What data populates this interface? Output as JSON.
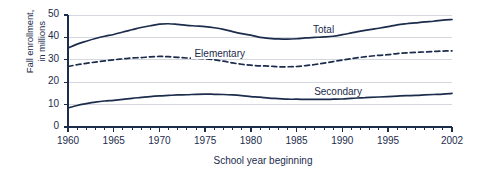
{
  "chart_data": {
    "type": "line",
    "title": "",
    "xlabel": "School year beginning",
    "ylabel_line1": "Fall enrollment,",
    "ylabel_line2": "in millions",
    "ylabel": "Fall enrollment, in millions",
    "xlim": [
      1960,
      2002
    ],
    "ylim": [
      0,
      50
    ],
    "grid": true,
    "gridlines_y": [
      0,
      10,
      20,
      30,
      40,
      50
    ],
    "legend_position": "inline-labels",
    "yticks": [
      0,
      10,
      20,
      30,
      40,
      50
    ],
    "ytick_labels": [
      "0",
      "10",
      "20",
      "30",
      "40",
      "50"
    ],
    "xticks": [
      1960,
      1965,
      1970,
      1975,
      1980,
      1985,
      1990,
      1995,
      2002
    ],
    "xtick_labels": [
      "1960",
      "1965",
      "1970",
      "1975",
      "1980",
      "1985",
      "1990",
      "1995",
      "2002"
    ],
    "minor_xticks_every": 1,
    "x": [
      1960,
      1961,
      1962,
      1963,
      1964,
      1965,
      1966,
      1967,
      1968,
      1969,
      1970,
      1971,
      1972,
      1973,
      1974,
      1975,
      1976,
      1977,
      1978,
      1979,
      1980,
      1981,
      1982,
      1983,
      1984,
      1985,
      1986,
      1987,
      1988,
      1989,
      1990,
      1991,
      1992,
      1993,
      1994,
      1995,
      1996,
      1997,
      1998,
      1999,
      2000,
      2001,
      2002
    ],
    "series": [
      {
        "name": "Total",
        "style": "solid",
        "color": "#1c2c4c",
        "label_text": "Total",
        "values": [
          35.2,
          37.0,
          38.3,
          39.5,
          40.5,
          41.3,
          42.4,
          43.4,
          44.4,
          45.2,
          45.9,
          46.1,
          45.8,
          45.4,
          45.1,
          44.8,
          44.3,
          43.6,
          42.6,
          41.7,
          41.0,
          40.0,
          39.6,
          39.3,
          39.2,
          39.4,
          39.8,
          40.0,
          40.2,
          40.5,
          41.2,
          42.0,
          42.8,
          43.5,
          44.1,
          44.8,
          45.6,
          46.1,
          46.5,
          46.9,
          47.2,
          47.7,
          48.0
        ]
      },
      {
        "name": "Elementary",
        "style": "dashed",
        "color": "#1c2c4c",
        "label_text": "Elementary",
        "values": [
          27.0,
          27.8,
          28.4,
          29.0,
          29.5,
          30.0,
          30.4,
          30.8,
          31.0,
          31.3,
          31.5,
          31.4,
          31.1,
          30.8,
          30.6,
          30.5,
          30.0,
          29.4,
          28.6,
          28.0,
          27.6,
          27.3,
          27.2,
          26.9,
          26.9,
          27.0,
          27.4,
          27.9,
          28.5,
          29.2,
          29.9,
          30.5,
          31.1,
          31.6,
          32.0,
          32.3,
          32.8,
          33.1,
          33.3,
          33.5,
          33.7,
          33.9,
          34.0
        ]
      },
      {
        "name": "Secondary",
        "style": "solid",
        "color": "#1c2c4c",
        "label_text": "Secondary",
        "values": [
          8.5,
          9.6,
          10.4,
          11.1,
          11.6,
          11.9,
          12.3,
          12.8,
          13.2,
          13.6,
          13.9,
          14.1,
          14.3,
          14.4,
          14.6,
          14.7,
          14.6,
          14.5,
          14.3,
          14.0,
          13.6,
          13.3,
          12.9,
          12.7,
          12.4,
          12.4,
          12.3,
          12.3,
          12.3,
          12.4,
          12.5,
          12.8,
          13.0,
          13.2,
          13.4,
          13.6,
          13.8,
          14.0,
          14.1,
          14.3,
          14.5,
          14.7,
          15.0
        ]
      }
    ]
  },
  "colors": {
    "line": "#1c2c4c",
    "grid": "#d4d8de",
    "axis": "#1c2c4c",
    "text": "#1c2c4c",
    "background": "#ffffff"
  }
}
